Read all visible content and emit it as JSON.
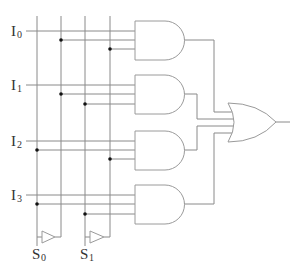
{
  "diagram": {
    "inputs": [
      {
        "letter": "I",
        "sub": "0"
      },
      {
        "letter": "I",
        "sub": "1"
      },
      {
        "letter": "I",
        "sub": "2"
      },
      {
        "letter": "I",
        "sub": "3"
      }
    ],
    "selects": [
      {
        "letter": "S",
        "sub": "0"
      },
      {
        "letter": "S",
        "sub": "1"
      }
    ],
    "gates": {
      "and_count": 4,
      "or_count": 1,
      "not_count": 2
    },
    "colors": {
      "wire": "#8a8a8a",
      "gate_outline": "#9a9a9a",
      "junction": "#111111",
      "label": "#333333",
      "background": "#ffffff"
    }
  }
}
